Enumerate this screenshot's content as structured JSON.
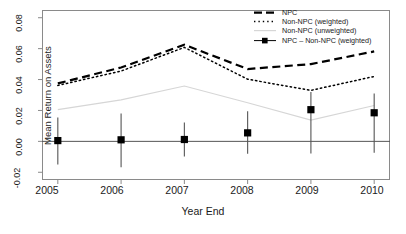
{
  "chart_data": {
    "type": "line",
    "title": "",
    "xlabel": "Year End",
    "ylabel": "Mean Return on Assets",
    "x": [
      2005,
      2006,
      2007,
      2008,
      2009,
      2010
    ],
    "xticklabels": [
      "2005",
      "2006",
      "2007",
      "2008",
      "2009",
      "2010"
    ],
    "yticklabels": [
      "-0.02",
      "0.00",
      "0.02",
      "0.04",
      "0.06",
      "0.08"
    ],
    "ytickvalues": [
      -0.02,
      0.0,
      0.02,
      0.04,
      0.06,
      0.08
    ],
    "xlim": [
      2004.75,
      2010.25
    ],
    "ylim": [
      -0.025,
      0.085
    ],
    "grid": false,
    "legend_position": "top-right",
    "series": [
      {
        "name": "NPC",
        "style": "dashed",
        "color": "#000000",
        "width": 2.2,
        "values": [
          0.0375,
          0.0478,
          0.0625,
          0.0468,
          0.05,
          0.0582
        ]
      },
      {
        "name": "Non-NPC (weighted)",
        "style": "dotted",
        "color": "#000000",
        "width": 1.5,
        "values": [
          0.0362,
          0.0455,
          0.0608,
          0.0402,
          0.033,
          0.042
        ]
      },
      {
        "name": "Non-NPC (unweighted)",
        "style": "solid",
        "color": "#d6d6d6",
        "width": 1.2,
        "values": [
          0.0205,
          0.0268,
          0.0358,
          0.025,
          0.0138,
          0.0232
        ]
      },
      {
        "name": "NPC – Non-NPC (weighted)",
        "style": "solid-square-errorbar",
        "color": "#000000",
        "width": 1.0,
        "values": [
          0.0005,
          0.001,
          0.0012,
          0.0055,
          0.0205,
          0.0185
        ],
        "error_low": [
          -0.015,
          -0.0168,
          -0.0098,
          -0.008,
          -0.0078,
          -0.0073
        ],
        "error_high": [
          0.0155,
          0.018,
          0.0122,
          0.0195,
          0.032,
          0.031
        ]
      }
    ]
  },
  "legend": {
    "entries": [
      {
        "label": "NPC"
      },
      {
        "label": "Non-NPC (weighted)"
      },
      {
        "label": "Non-NPC (unweighted)"
      },
      {
        "label": "NPC – Non-NPC (weighted)"
      }
    ]
  }
}
